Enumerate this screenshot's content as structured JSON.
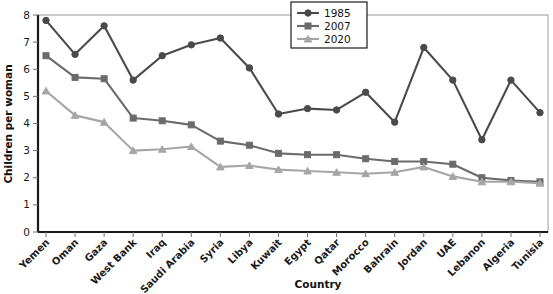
{
  "chart_data": {
    "type": "line",
    "title": "",
    "xlabel": "Country",
    "ylabel": "Children per woman",
    "ylim": [
      0,
      8
    ],
    "ytick_labels": [
      "0",
      "1",
      "2",
      "3",
      "4",
      "5",
      "6",
      "7",
      "8"
    ],
    "grid": false,
    "legend_position": "top-right",
    "categories": [
      "Yemen",
      "Oman",
      "Gaza",
      "West Bank",
      "Iraq",
      "Saudi Arabia",
      "Syria",
      "Libya",
      "Kuwait",
      "Egypt",
      "Qatar",
      "Morocco",
      "Bahrain",
      "Jordan",
      "UAE",
      "Lebanon",
      "Algeria",
      "Tunisia"
    ],
    "series": [
      {
        "name": "1985",
        "color": "#4a4a4a",
        "marker": "circle",
        "values": [
          7.8,
          6.55,
          7.6,
          5.6,
          6.5,
          6.9,
          7.15,
          6.05,
          4.35,
          4.55,
          4.5,
          5.15,
          4.05,
          6.8,
          5.6,
          3.4,
          5.6,
          4.4
        ]
      },
      {
        "name": "2007",
        "color": "#6b6b6b",
        "marker": "square",
        "values": [
          6.5,
          5.7,
          5.65,
          4.2,
          4.1,
          3.95,
          3.35,
          3.2,
          2.9,
          2.85,
          2.85,
          2.7,
          2.6,
          2.6,
          2.5,
          2.0,
          1.9,
          1.85
        ]
      },
      {
        "name": "2020",
        "color": "#a6a6a6",
        "marker": "triangle",
        "values": [
          5.2,
          4.3,
          4.05,
          3.0,
          3.05,
          3.15,
          2.4,
          2.45,
          2.3,
          2.25,
          2.2,
          2.15,
          2.2,
          2.4,
          2.05,
          1.85,
          1.85,
          1.8
        ]
      }
    ]
  },
  "axes": {
    "y_label": "Children per woman",
    "x_label": "Country"
  },
  "legend": {
    "items": [
      {
        "label": "1985"
      },
      {
        "label": "2007"
      },
      {
        "label": "2020"
      }
    ]
  }
}
